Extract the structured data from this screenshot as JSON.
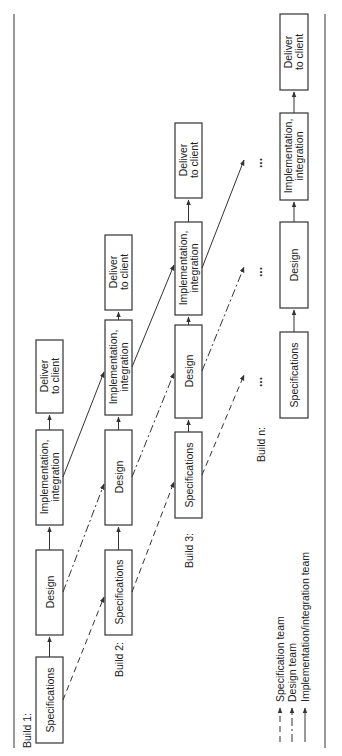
{
  "diagram": {
    "orientation": "rotated-90-ccw",
    "builds": [
      {
        "label": "Build 1:",
        "steps": [
          {
            "line1": "Specifications",
            "line2": ""
          },
          {
            "line1": "Design",
            "line2": ""
          },
          {
            "line1": "Implementation,",
            "line2": "integration"
          },
          {
            "line1": "Deliver",
            "line2": "to client"
          }
        ]
      },
      {
        "label": "Build 2:",
        "steps": [
          {
            "line1": "Specifications",
            "line2": ""
          },
          {
            "line1": "Design",
            "line2": ""
          },
          {
            "line1": "Implementation,",
            "line2": "integration"
          },
          {
            "line1": "Deliver",
            "line2": "to client"
          }
        ]
      },
      {
        "label": "Build 3:",
        "steps": [
          {
            "line1": "Specifications",
            "line2": ""
          },
          {
            "line1": "Design",
            "line2": ""
          },
          {
            "line1": "Implementation,",
            "line2": "integration"
          },
          {
            "line1": "Deliver",
            "line2": "to client"
          }
        ]
      },
      {
        "label": "Build n:",
        "steps": [
          {
            "line1": "Specifications",
            "line2": ""
          },
          {
            "line1": "Design",
            "line2": ""
          },
          {
            "line1": "Implementation,",
            "line2": "integration"
          },
          {
            "line1": "Deliver",
            "line2": "to client"
          }
        ]
      }
    ],
    "ellipsis": "...",
    "legend": [
      {
        "style": "dashed",
        "label": "Specification team"
      },
      {
        "style": "dash-dot",
        "label": "Design team"
      },
      {
        "style": "solid",
        "label": "Implementation/integration team"
      }
    ],
    "colors": {
      "line": "#333333",
      "text": "#222222",
      "background": "#ffffff"
    }
  }
}
